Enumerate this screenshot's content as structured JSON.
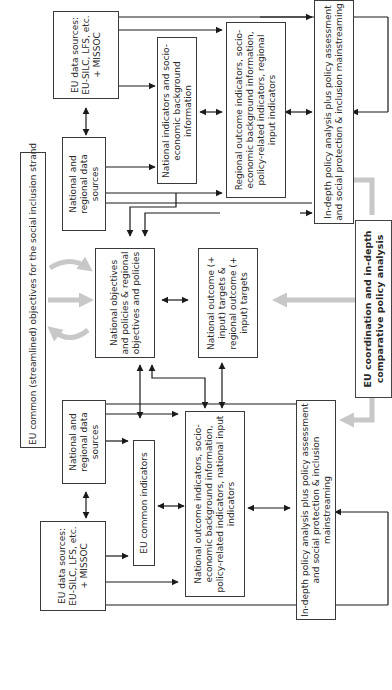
{
  "diagram": {
    "orientation": "rotated-90-ccw",
    "colors": {
      "line": "#1a1a1a",
      "box_border": "#3a3a3a",
      "grey_arrow": "#c8c8c8",
      "background": "#ffffff"
    },
    "boxes": {
      "eu_objectives": "EU common (streamlined) objectives for the social inclusion strand",
      "eu_data_sources_top": "EU data sources: EU-SILC, LFS, etc. + MISSOC",
      "national_regional_data_top": "National and regional data sources",
      "national_indicators_bg": "National indicators and socio-economic background information",
      "regional_outcome_indicators": "Regional outcome indicators, socio-economic background information, policy-related indicators, regional input indicators",
      "indepth_top": "In-depth policy analysis plus policy assessment and social protection & inclusion mainstreaming",
      "national_objectives": "National objectives and policies & regional objectives and policies",
      "national_outcome_targets": "National outcome (+ input) targets & regional outcome (+ input) targets",
      "eu_coordination": "EU coordination and in-depth comparative policy analysis",
      "national_regional_data_bottom": "National and regional data sources",
      "eu_common_indicators": "EU common indicators",
      "eu_data_sources_bottom": "EU data sources: EU-SILC, LFS, etc. + MISSOC",
      "national_outcome_indicators": "National outcome indicators, socio-economic background information, policy-related indicators, national input indicators",
      "indepth_bottom": "In-depth policy analysis plus policy assessment and social protection & inclusion mainstreaming"
    },
    "icons": {
      "arrow": "arrow-icon",
      "double_arrow": "double-arrow-icon",
      "grey_arrow": "grey-arrow-icon"
    }
  }
}
